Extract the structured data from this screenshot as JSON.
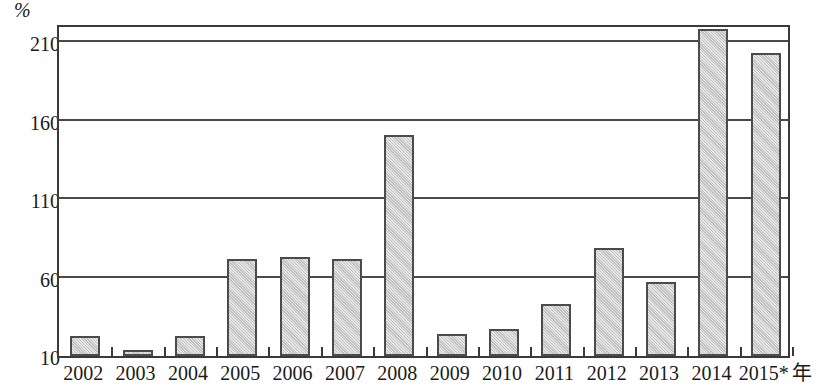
{
  "chart_data": {
    "type": "bar",
    "title": "",
    "subtitle": "",
    "xlabel": "年",
    "ylabel": "%",
    "categories": [
      "2002",
      "2003",
      "2004",
      "2005",
      "2006",
      "2007",
      "2008",
      "2009",
      "2010",
      "2011",
      "2012",
      "2013",
      "2014",
      "2015*"
    ],
    "values": [
      23,
      14,
      23,
      72,
      73,
      72,
      151,
      24,
      27,
      43,
      79,
      57,
      218,
      203
    ],
    "series": [
      {
        "name": "",
        "values": [
          23,
          14,
          23,
          72,
          73,
          72,
          151,
          24,
          27,
          43,
          79,
          57,
          218,
          203
        ]
      }
    ],
    "ylim": [
      10,
      222
    ],
    "y_ticks": [
      10,
      60,
      110,
      160,
      210
    ],
    "y_tick_labels": [
      "10",
      "60",
      "110",
      "160",
      "210"
    ],
    "grid": true,
    "grid_axis": "y",
    "legend": false,
    "legend_position": "none",
    "bar_fill_color": "#c9c9c9",
    "bar_border_color": "#4b4b4b",
    "axis_color": "#3a3a3a",
    "grid_color": "#4a4a4a",
    "background_color": "#ffffff",
    "annotations": [
      "2015* 年"
    ]
  },
  "axes": {
    "y_unit_label": "%",
    "x_unit_label": "年",
    "y_ticks": [
      {
        "label": "210",
        "value": 210
      },
      {
        "label": "160",
        "value": 160
      },
      {
        "label": "110",
        "value": 110
      },
      {
        "label": "60",
        "value": 60
      },
      {
        "label": "10",
        "value": 10
      }
    ],
    "x_ticks": [
      {
        "label": "2002"
      },
      {
        "label": "2003"
      },
      {
        "label": "2004"
      },
      {
        "label": "2005"
      },
      {
        "label": "2006"
      },
      {
        "label": "2007"
      },
      {
        "label": "2008"
      },
      {
        "label": "2009"
      },
      {
        "label": "2010"
      },
      {
        "label": "2011"
      },
      {
        "label": "2012"
      },
      {
        "label": "2013"
      },
      {
        "label": "2014"
      },
      {
        "label": "2015*"
      }
    ]
  }
}
